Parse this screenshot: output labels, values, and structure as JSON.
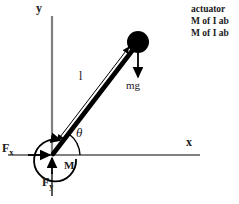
{
  "diagram": {
    "background_color": "#ffffff",
    "axis_color": "#808080",
    "stroke_color": "#000000",
    "text_color": "#1a1a1a",
    "axes": {
      "y_label": "y",
      "x_label": "x",
      "origin": {
        "x": 52,
        "y": 155
      },
      "y_axis_top": {
        "x": 52,
        "y": 16
      },
      "x_axis_right": {
        "x": 200,
        "y": 155
      }
    },
    "rod": {
      "label": "l",
      "pivot": {
        "x": 52,
        "y": 155
      },
      "bob_center": {
        "x": 138,
        "y": 42
      },
      "bob_radius": 11,
      "angle_label": "θ",
      "angle_from_x_axis_deg": 53
    },
    "forces": {
      "weight_label": "mg",
      "weight_direction": "down",
      "reaction_x_label": "F",
      "reaction_x_subscript": "x",
      "reaction_x_direction": "right",
      "reaction_y_label": "F",
      "reaction_y_subscript": "y",
      "reaction_y_direction": "up",
      "moment_label": "M",
      "moment_direction": "counter-clockwise"
    }
  },
  "notes": {
    "lines": [
      "actuator",
      "M of I ab",
      "M of I ab"
    ]
  }
}
